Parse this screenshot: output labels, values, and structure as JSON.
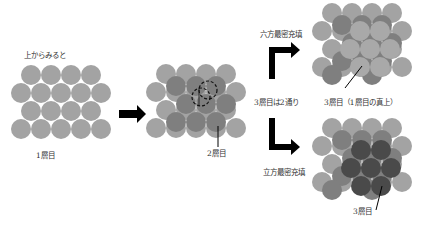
{
  "labels": {
    "view_from_top": "上からみると",
    "layer1": "1層目",
    "layer2": "2層目",
    "hcp": "六方最密充填",
    "two_ways": "3層目は2通り",
    "layer3_hcp": "3層目（1層目の真上）",
    "ccp": "立方最密充填",
    "layer3_ccp": "3層目"
  },
  "colors": {
    "layer1": "#a3a3a3",
    "layer2": "#7f7f7f",
    "layer3_hcp": "#a9a9a9",
    "layer3_ccp": "#4a4a4a",
    "arrow": "#000000",
    "text": "#333333"
  },
  "icons": {
    "right-arrow": "arrow-right-icon",
    "hcp-arrow": "elbow-arrow-up-right-icon",
    "ccp-arrow": "elbow-arrow-down-right-icon"
  }
}
